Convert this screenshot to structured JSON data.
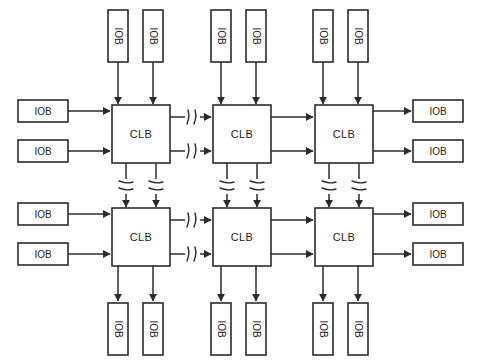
{
  "diagram": {
    "type": "block-diagram",
    "canvas": {
      "width": 478,
      "height": 363,
      "background": "#ffffff"
    },
    "stroke_color": "#2b2b2b",
    "fill_color": "#ffffff",
    "labels": {
      "clb": "CLB",
      "iob": "IOB"
    },
    "grid": {
      "clb_rows": 2,
      "clb_columns": 3
    },
    "clb_blocks": [
      {
        "id": "clb-r1-c1",
        "label": "CLB",
        "row": 1,
        "col": 1,
        "x": 112,
        "y": 105,
        "w": 58,
        "h": 58
      },
      {
        "id": "clb-r1-c2",
        "label": "CLB",
        "row": 1,
        "col": 2,
        "x": 213,
        "y": 105,
        "w": 58,
        "h": 58
      },
      {
        "id": "clb-r1-c3",
        "label": "CLB",
        "row": 1,
        "col": 3,
        "x": 315,
        "y": 105,
        "w": 58,
        "h": 58
      },
      {
        "id": "clb-r2-c1",
        "label": "CLB",
        "row": 2,
        "col": 1,
        "x": 112,
        "y": 208,
        "w": 58,
        "h": 58
      },
      {
        "id": "clb-r2-c2",
        "label": "CLB",
        "row": 2,
        "col": 2,
        "x": 213,
        "y": 208,
        "w": 58,
        "h": 58
      },
      {
        "id": "clb-r2-c3",
        "label": "CLB",
        "row": 2,
        "col": 3,
        "x": 315,
        "y": 208,
        "w": 58,
        "h": 58
      }
    ],
    "iob_blocks_top": [
      {
        "id": "iob-top-1",
        "label": "IOB",
        "x": 108,
        "y": 10,
        "w": 20,
        "h": 52,
        "orientation": "vertical"
      },
      {
        "id": "iob-top-2",
        "label": "IOB",
        "x": 143,
        "y": 10,
        "w": 20,
        "h": 52,
        "orientation": "vertical"
      },
      {
        "id": "iob-top-3",
        "label": "IOB",
        "x": 211,
        "y": 10,
        "w": 20,
        "h": 52,
        "orientation": "vertical"
      },
      {
        "id": "iob-top-4",
        "label": "IOB",
        "x": 246,
        "y": 10,
        "w": 20,
        "h": 52,
        "orientation": "vertical"
      },
      {
        "id": "iob-top-5",
        "label": "IOB",
        "x": 313,
        "y": 10,
        "w": 20,
        "h": 52,
        "orientation": "vertical"
      },
      {
        "id": "iob-top-6",
        "label": "IOB",
        "x": 348,
        "y": 10,
        "w": 20,
        "h": 52,
        "orientation": "vertical"
      }
    ],
    "iob_blocks_bottom": [
      {
        "id": "iob-bottom-1",
        "label": "IOB",
        "x": 108,
        "y": 303,
        "w": 20,
        "h": 52,
        "orientation": "vertical"
      },
      {
        "id": "iob-bottom-2",
        "label": "IOB",
        "x": 143,
        "y": 303,
        "w": 20,
        "h": 52,
        "orientation": "vertical"
      },
      {
        "id": "iob-bottom-3",
        "label": "IOB",
        "x": 211,
        "y": 303,
        "w": 20,
        "h": 52,
        "orientation": "vertical"
      },
      {
        "id": "iob-bottom-4",
        "label": "IOB",
        "x": 246,
        "y": 303,
        "w": 20,
        "h": 52,
        "orientation": "vertical"
      },
      {
        "id": "iob-bottom-5",
        "label": "IOB",
        "x": 313,
        "y": 303,
        "w": 20,
        "h": 52,
        "orientation": "vertical"
      },
      {
        "id": "iob-bottom-6",
        "label": "IOB",
        "x": 348,
        "y": 303,
        "w": 20,
        "h": 52,
        "orientation": "vertical"
      }
    ],
    "iob_blocks_left": [
      {
        "id": "iob-left-1",
        "label": "IOB",
        "x": 18,
        "y": 100,
        "w": 50,
        "h": 22,
        "orientation": "horizontal"
      },
      {
        "id": "iob-left-2",
        "label": "IOB",
        "x": 18,
        "y": 140,
        "w": 50,
        "h": 22,
        "orientation": "horizontal"
      },
      {
        "id": "iob-left-3",
        "label": "IOB",
        "x": 18,
        "y": 203,
        "w": 50,
        "h": 22,
        "orientation": "horizontal"
      },
      {
        "id": "iob-left-4",
        "label": "IOB",
        "x": 18,
        "y": 243,
        "w": 50,
        "h": 22,
        "orientation": "horizontal"
      }
    ],
    "iob_blocks_right": [
      {
        "id": "iob-right-1",
        "label": "IOB",
        "x": 413,
        "y": 100,
        "w": 50,
        "h": 22,
        "orientation": "horizontal"
      },
      {
        "id": "iob-right-2",
        "label": "IOB",
        "x": 413,
        "y": 140,
        "w": 50,
        "h": 22,
        "orientation": "horizontal"
      },
      {
        "id": "iob-right-3",
        "label": "IOB",
        "x": 413,
        "y": 203,
        "w": 50,
        "h": 22,
        "orientation": "horizontal"
      },
      {
        "id": "iob-right-4",
        "label": "IOB",
        "x": 413,
        "y": 243,
        "w": 50,
        "h": 22,
        "orientation": "horizontal"
      }
    ],
    "break_symbols": {
      "description": "squiggle break markers on interconnect wires",
      "horizontal": [
        {
          "x": 192,
          "y": 117
        },
        {
          "x": 192,
          "y": 151
        },
        {
          "x": 192,
          "y": 220
        },
        {
          "x": 192,
          "y": 254
        }
      ],
      "vertical": [
        {
          "x": 126,
          "y": 186
        },
        {
          "x": 156,
          "y": 186
        },
        {
          "x": 227,
          "y": 186
        },
        {
          "x": 257,
          "y": 186
        },
        {
          "x": 329,
          "y": 186
        },
        {
          "x": 359,
          "y": 186
        }
      ]
    },
    "counts": {
      "total_clb": 6,
      "total_iob": 20,
      "iob_top": 6,
      "iob_bottom": 6,
      "iob_left": 4,
      "iob_right": 4
    }
  }
}
